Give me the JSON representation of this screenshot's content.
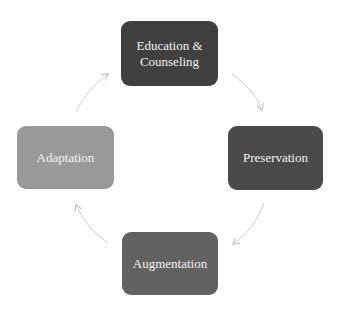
{
  "diagram": {
    "type": "cycle",
    "nodes": [
      {
        "id": "top",
        "label": "Education &\nCounseling",
        "color": "#404040"
      },
      {
        "id": "right",
        "label": "Preservation",
        "color": "#4a4a4a"
      },
      {
        "id": "bottom",
        "label": "Augmentation",
        "color": "#626262"
      },
      {
        "id": "left",
        "label": "Adaptation",
        "color": "#999999"
      }
    ],
    "edges": [
      {
        "from": "top",
        "to": "right",
        "direction": "clockwise"
      },
      {
        "from": "right",
        "to": "bottom",
        "direction": "clockwise"
      },
      {
        "from": "bottom",
        "to": "left",
        "direction": "clockwise"
      },
      {
        "from": "left",
        "to": "top",
        "direction": "clockwise"
      }
    ],
    "arrow_color": "#c8c8c8"
  }
}
